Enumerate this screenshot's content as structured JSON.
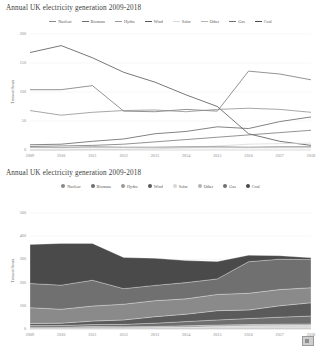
{
  "page": {
    "background": "#ffffff",
    "logo_name": "cb-watermark"
  },
  "charts": [
    {
      "id": "line-chart",
      "title": "Annual UK electricity generation 2009-2018",
      "ylabel": "Terawatt hours",
      "legend_style": "line"
    },
    {
      "id": "area-chart",
      "title": "Annual UK electricity generation 2009-2018",
      "ylabel": "Terawatt hours",
      "legend_style": "dot"
    }
  ],
  "legend": {
    "items": [
      {
        "label": "Nuclear",
        "color": "#8a8a8a"
      },
      {
        "label": "Biomass",
        "color": "#6f6f6f"
      },
      {
        "label": "Hydro",
        "color": "#9a9a9a"
      },
      {
        "label": "Wind",
        "color": "#5a5a5a"
      },
      {
        "label": "Solar",
        "color": "#d8d8d8"
      },
      {
        "label": "Other",
        "color": "#b4b4b4"
      },
      {
        "label": "Gas",
        "color": "#707070"
      },
      {
        "label": "Coal",
        "color": "#4a4a4a"
      }
    ]
  },
  "chart_data": [
    {
      "type": "line",
      "title": "Annual UK electricity generation 2009-2018",
      "xlabel": "",
      "ylabel": "Terawatt hours",
      "x": [
        2009,
        2010,
        2011,
        2012,
        2013,
        2014,
        2015,
        2016,
        2017,
        2018
      ],
      "xlim": [
        2009,
        2018
      ],
      "ylim": [
        0,
        200
      ],
      "yticks": [
        0,
        50,
        100,
        150,
        200
      ],
      "xticks": [
        "2009",
        "2010",
        "2011",
        "2012",
        "2013",
        "2014",
        "2015",
        "2016",
        "2017",
        "2018"
      ],
      "grid": true,
      "legend_position": "top-center",
      "series": [
        {
          "name": "Coal",
          "color": "#4a4a4a",
          "values": [
            168,
            180,
            159,
            134,
            117,
            95,
            75,
            28,
            15,
            8
          ]
        },
        {
          "name": "Gas",
          "color": "#707070",
          "values": [
            104,
            104,
            111,
            67,
            66,
            70,
            67,
            136,
            131,
            121
          ]
        },
        {
          "name": "Nuclear",
          "color": "#8a8a8a",
          "values": [
            68,
            60,
            65,
            68,
            69,
            66,
            70,
            72,
            70,
            65
          ]
        },
        {
          "name": "Wind",
          "color": "#5a5a5a",
          "values": [
            9,
            10,
            15,
            19,
            28,
            32,
            40,
            37,
            49,
            57
          ]
        },
        {
          "name": "Biomass",
          "color": "#6f6f6f",
          "values": [
            6,
            7,
            8,
            10,
            14,
            18,
            22,
            26,
            30,
            34
          ]
        },
        {
          "name": "Solar",
          "color": "#d8d8d8",
          "values": [
            0,
            0,
            1,
            1,
            2,
            4,
            7,
            10,
            11,
            12
          ]
        },
        {
          "name": "Hydro",
          "color": "#9a9a9a",
          "values": [
            5,
            4,
            6,
            5,
            5,
            6,
            6,
            5,
            6,
            6
          ]
        },
        {
          "name": "Other",
          "color": "#b4b4b4",
          "values": [
            4,
            4,
            4,
            4,
            4,
            4,
            4,
            4,
            4,
            4
          ]
        }
      ]
    },
    {
      "type": "area",
      "stacked": true,
      "title": "Annual UK electricity generation 2009-2018",
      "xlabel": "",
      "ylabel": "Terawatt hours",
      "x": [
        2009,
        2010,
        2011,
        2012,
        2013,
        2014,
        2015,
        2016,
        2017,
        2018
      ],
      "xlim": [
        2009,
        2018
      ],
      "ylim": [
        0,
        500
      ],
      "yticks": [
        0,
        100,
        200,
        300,
        400,
        500
      ],
      "xticks": [
        "2009",
        "2010",
        "2011",
        "2012",
        "2013",
        "2014",
        "2015",
        "2016",
        "2017",
        "2018"
      ],
      "grid": true,
      "legend_position": "top-center",
      "series": [
        {
          "name": "Other",
          "color": "#b4b4b4",
          "values": [
            4,
            4,
            4,
            4,
            4,
            4,
            4,
            4,
            4,
            4
          ]
        },
        {
          "name": "Solar",
          "color": "#d8d8d8",
          "values": [
            0,
            0,
            1,
            1,
            2,
            4,
            7,
            10,
            11,
            12
          ]
        },
        {
          "name": "Hydro",
          "color": "#9a9a9a",
          "values": [
            5,
            4,
            6,
            5,
            5,
            6,
            6,
            5,
            6,
            6
          ]
        },
        {
          "name": "Biomass",
          "color": "#6f6f6f",
          "values": [
            6,
            7,
            8,
            10,
            14,
            18,
            22,
            26,
            30,
            34
          ]
        },
        {
          "name": "Wind",
          "color": "#5a5a5a",
          "values": [
            9,
            10,
            15,
            19,
            28,
            32,
            40,
            37,
            49,
            57
          ]
        },
        {
          "name": "Nuclear",
          "color": "#8a8a8a",
          "values": [
            68,
            60,
            65,
            68,
            69,
            66,
            70,
            72,
            70,
            65
          ]
        },
        {
          "name": "Gas",
          "color": "#707070",
          "values": [
            104,
            104,
            111,
            67,
            66,
            70,
            67,
            136,
            131,
            121
          ]
        },
        {
          "name": "Coal",
          "color": "#4a4a4a",
          "values": [
            168,
            180,
            159,
            134,
            117,
            95,
            75,
            28,
            15,
            8
          ]
        }
      ]
    }
  ]
}
